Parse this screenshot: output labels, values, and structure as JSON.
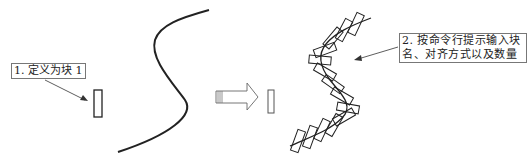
{
  "diagram": {
    "labels": {
      "step1": "1. 定义为块 1",
      "step2_line1": "2. 按命令行提示输入块",
      "step2_line2": "名、对齐方式以及数量"
    },
    "colors": {
      "stroke": "#222222",
      "label_border": "#777777",
      "background": "#ffffff"
    },
    "elements": [
      {
        "name": "block-definition",
        "type": "rectangle"
      },
      {
        "name": "s-curve-path",
        "type": "curve"
      },
      {
        "name": "transform-arrow",
        "type": "block-arrow"
      },
      {
        "name": "block-result",
        "type": "rectangle"
      },
      {
        "name": "measured-blocks-along-curve",
        "type": "curve-with-blocks"
      }
    ]
  }
}
